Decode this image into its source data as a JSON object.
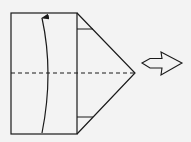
{
  "diagram": {
    "type": "origami-fold-step",
    "background": "#f3f3f3",
    "stroke_color": "#1a1a1a",
    "paper": {
      "rect": {
        "x": 11,
        "y": 13,
        "width": 66,
        "height": 121
      },
      "triangle_tip": {
        "x": 135,
        "y": 73
      }
    },
    "crease_marks": [
      {
        "x1": 77,
        "y1": 29,
        "x2": 93,
        "y2": 29
      },
      {
        "x1": 77,
        "y1": 117,
        "x2": 93,
        "y2": 117
      }
    ],
    "valley_fold_line": {
      "x1": 11,
      "y1": 73,
      "x2": 135,
      "y2": 73,
      "style": "dashed"
    },
    "fold_arrow": {
      "from": {
        "x": 42,
        "y": 133
      },
      "to": {
        "x": 42,
        "y": 16
      },
      "curve_x": 52
    },
    "turn_over_arrow": {
      "direction": "right",
      "style": "hollow"
    }
  }
}
